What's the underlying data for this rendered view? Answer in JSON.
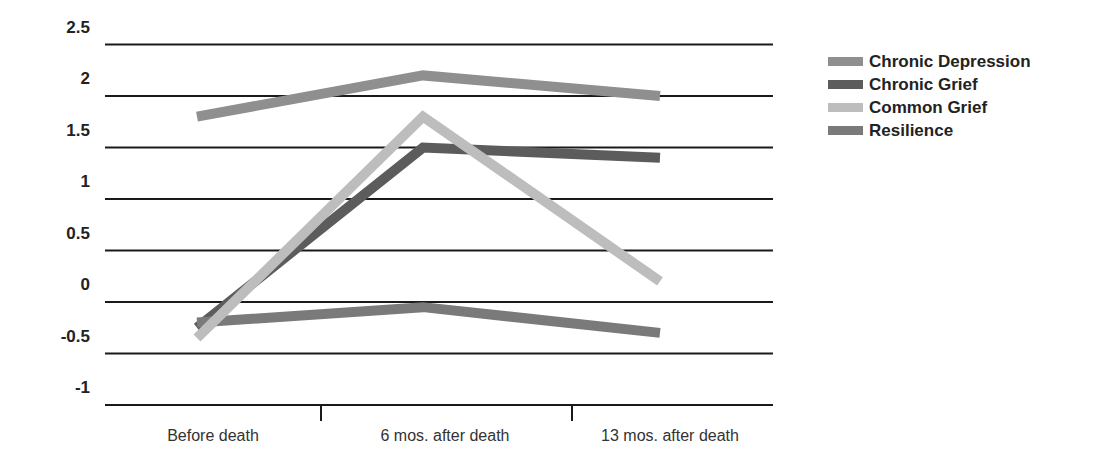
{
  "chart_data": {
    "type": "line",
    "title": "",
    "xlabel": "",
    "ylabel": "",
    "categories": [
      "Before death",
      "6 mos. after death",
      "13 mos. after death"
    ],
    "ylim": [
      -1,
      2.5
    ],
    "yticks": [
      "2.5",
      "2",
      "1.5",
      "1",
      "0.5",
      "0",
      "-0.5",
      "-1"
    ],
    "ytick_values": [
      2.5,
      2,
      1.5,
      1,
      0.5,
      0,
      -0.5,
      -1
    ],
    "grid": true,
    "legend_position": "right",
    "series": [
      {
        "name": "Chronic Depression",
        "values": [
          1.8,
          2.2,
          2.0
        ],
        "color": "#8f8f8f"
      },
      {
        "name": "Chronic Grief",
        "values": [
          -0.25,
          1.5,
          1.4
        ],
        "color": "#5c5c5c"
      },
      {
        "name": "Common Grief",
        "values": [
          -0.35,
          1.8,
          0.2
        ],
        "color": "#bdbdbd"
      },
      {
        "name": "Resilience",
        "values": [
          -0.2,
          -0.05,
          -0.3
        ],
        "color": "#7a7a7a"
      }
    ]
  },
  "legend": {
    "items": [
      {
        "label": "Chronic Depression",
        "color": "#8f8f8f"
      },
      {
        "label": "Chronic Grief",
        "color": "#5c5c5c"
      },
      {
        "label": "Common Grief",
        "color": "#bdbdbd"
      },
      {
        "label": "Resilience",
        "color": "#7a7a7a"
      }
    ]
  }
}
